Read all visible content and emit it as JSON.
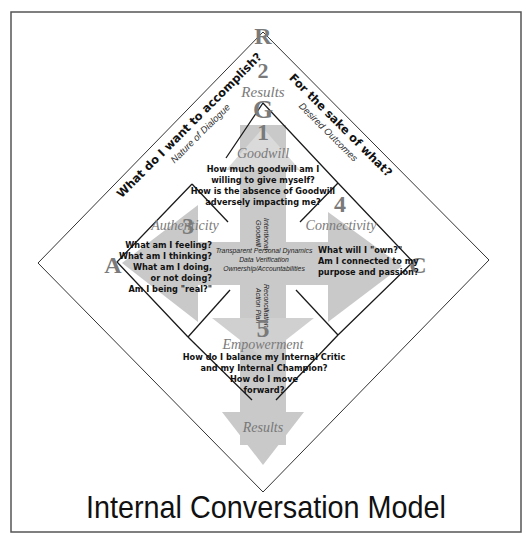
{
  "title": "Internal Conversation Model",
  "corners": {
    "top": "R",
    "inner_top": "G",
    "left": "A",
    "right": "C"
  },
  "results_zone": {
    "number": "2",
    "label": "Results"
  },
  "side_labels": {
    "left_question": "What do I want to accomplish?",
    "left_sub": "Nature of Dialogue",
    "right_question": "For the sake of what?",
    "right_sub": "Desired Outcomes"
  },
  "quadrants": [
    {
      "number": "1",
      "label": "Goodwill",
      "questions": [
        "How much goodwill am I",
        "willing to give myself?",
        "How is the absence of Goodwill",
        "adversely impacting me?"
      ]
    },
    {
      "number": "3",
      "label": "Authenticity",
      "questions": [
        "What am I feeling?",
        "What am I thinking?",
        "What am I doing,",
        "or not doing?",
        "Am I being \"real?\""
      ]
    },
    {
      "number": "4",
      "label": "Connectivity",
      "questions": [
        "What will I \"own?\"",
        "Am I connected to my",
        "purpose and passion?"
      ]
    },
    {
      "number": "5",
      "label": "Empowerment",
      "questions": [
        "How do I balance my Internal Critic",
        "and my Internal Champion?",
        "How do I move",
        "forward?"
      ]
    }
  ],
  "arrows": {
    "vertical_top_label": [
      "Intentional",
      "Goodwill"
    ],
    "center_label": [
      "Transparent Personal Dynamics",
      "Data Verification",
      "Ownership/Accountabilities"
    ],
    "vertical_bottom_label": [
      "Reconciliation",
      "Action Plan"
    ],
    "bottom_label": "Results"
  },
  "colors": {
    "arrow_fill": "#c8c8c8",
    "line": "#1a1a1a",
    "frame": "#555555",
    "heading_gray": "#7a7a7a",
    "text": "#111111"
  }
}
